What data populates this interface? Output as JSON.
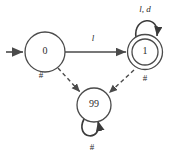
{
  "figure": {
    "type": "state-transition-diagram",
    "background_color": "#ffffff",
    "stroke_color": "#4a4a4a",
    "text_color": "#2b2b2b"
  },
  "states": [
    {
      "id": "s0",
      "label": "0",
      "kind": "start",
      "accepting": false,
      "cx": 45,
      "cy": 52,
      "r": 20
    },
    {
      "id": "s1",
      "label": "1",
      "kind": "accepting",
      "accepting": true,
      "cx": 145,
      "cy": 52,
      "r": 17
    },
    {
      "id": "s99",
      "label": "99",
      "kind": "trap",
      "accepting": false,
      "cx": 94,
      "cy": 105,
      "r": 17
    }
  ],
  "transitions": [
    {
      "id": "start-arrow",
      "from": "",
      "to": "s0",
      "label": "",
      "style": "solid"
    },
    {
      "id": "t0-1",
      "from": "s0",
      "to": "s1",
      "label": "l",
      "style": "solid"
    },
    {
      "id": "t1-1",
      "from": "s1",
      "to": "s1",
      "label": "l, d",
      "style": "solid",
      "self_loop": true
    },
    {
      "id": "t0-99",
      "from": "s0",
      "to": "s99",
      "label": "#",
      "style": "dashed"
    },
    {
      "id": "t1-99",
      "from": "s1",
      "to": "s99",
      "label": "#",
      "style": "dashed"
    },
    {
      "id": "t99-99",
      "from": "s99",
      "to": "s99",
      "label": "#",
      "style": "solid",
      "self_loop": true
    }
  ],
  "labels": {
    "state_0": "0",
    "state_1": "1",
    "state_99": "99",
    "edge_0_to_1": "l",
    "loop_1": "l, d",
    "hash_from_0": "#",
    "hash_from_1": "#",
    "loop_99": "#"
  }
}
